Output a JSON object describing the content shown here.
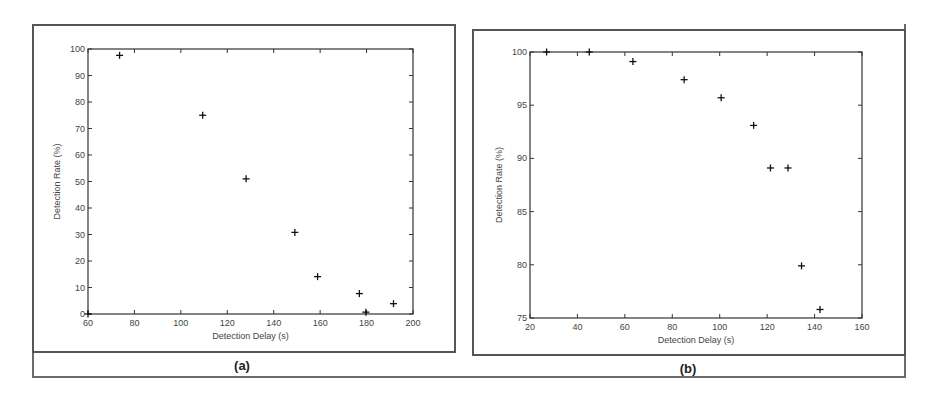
{
  "figure": {
    "captions": {
      "a": "(a)",
      "b": "(b)"
    }
  },
  "chart_data": [
    {
      "id": "a",
      "type": "scatter",
      "title": "",
      "caption": "(a)",
      "xlabel": "Detection Delay (s)",
      "ylabel": "Detection Rate (%)",
      "xlim": [
        60,
        200
      ],
      "ylim": [
        0,
        100
      ],
      "xticks": [
        60,
        80,
        100,
        120,
        140,
        160,
        180,
        200
      ],
      "yticks": [
        0,
        10,
        20,
        30,
        40,
        50,
        60,
        70,
        80,
        90,
        100
      ],
      "grid": false,
      "marker": "+",
      "x": [
        60,
        73.6,
        109.4,
        128.1,
        149.1,
        158.9,
        176.9,
        179.7,
        191.6
      ],
      "y": [
        0,
        97.6,
        75,
        51,
        30.8,
        14.1,
        7.7,
        0.7,
        3.9
      ]
    },
    {
      "id": "b",
      "type": "scatter",
      "title": "",
      "caption": "(b)",
      "xlabel": "Detection Delay (s)",
      "ylabel": "Detection Rate (%)",
      "xlim": [
        20,
        160
      ],
      "ylim": [
        75,
        100
      ],
      "xticks": [
        20,
        40,
        60,
        80,
        100,
        120,
        140,
        160
      ],
      "yticks": [
        75,
        80,
        85,
        90,
        95,
        100
      ],
      "grid": false,
      "marker": "+",
      "x": [
        27,
        45,
        63.4,
        85,
        100.6,
        114.3,
        121.4,
        128.8,
        134.5,
        142.3
      ],
      "y": [
        100,
        100,
        99.1,
        97.4,
        95.7,
        93.1,
        89.1,
        89.1,
        79.9,
        75.8
      ]
    }
  ],
  "colors": {
    "axis": "#333333",
    "marker": "#111111",
    "frame": "#555555"
  }
}
